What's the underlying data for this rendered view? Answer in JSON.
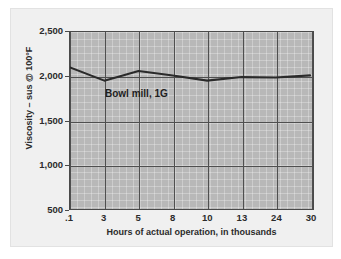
{
  "chart_data": {
    "type": "line",
    "title": "",
    "xlabel": "Hours of actual operation, in thousands",
    "ylabel": "Viscosity – sus @ 100°F",
    "categories": [
      ".1",
      "3",
      "5",
      "8",
      "10",
      "13",
      "24",
      "30"
    ],
    "values": [
      2100,
      1950,
      2060,
      2010,
      1950,
      1990,
      1985,
      2010
    ],
    "series": [
      {
        "name": "Bowl mill, 1G",
        "values": [
          2100,
          1950,
          2060,
          2010,
          1950,
          1990,
          1985,
          2010
        ]
      }
    ],
    "ylim": [
      500,
      2500
    ],
    "yticks": [
      "500",
      "1,000",
      "1,500",
      "2,000",
      "2,500"
    ],
    "ytick_values": [
      500,
      1000,
      1500,
      2000,
      2500
    ],
    "xticks": [
      ".1",
      "3",
      "5",
      "8",
      "10",
      "13",
      "24",
      "30"
    ],
    "grid": true,
    "legend_position": "none",
    "annotations": [
      {
        "text": "Bowl mill, 1G",
        "x": "5",
        "y": 1700
      }
    ],
    "colors": {
      "plot_background": "#b8b8b8",
      "line": "#2a2a2a",
      "grid": "#4f4f4f",
      "axis": "#4a4a4a",
      "text": "#2b2b2b",
      "panel_background": "#f0f0f0"
    }
  },
  "axes": {
    "y": {
      "label": "Viscosity – sus @ 100°F",
      "ticks": [
        {
          "label": "2,500",
          "value": 2500
        },
        {
          "label": "2,000",
          "value": 2000
        },
        {
          "label": "1,500",
          "value": 1500
        },
        {
          "label": "1,000",
          "value": 1000
        },
        {
          "label": "500",
          "value": 500
        }
      ]
    },
    "x": {
      "label": "Hours of actual operation, in thousands",
      "ticks": [
        {
          "label": ".1"
        },
        {
          "label": "3"
        },
        {
          "label": "5"
        },
        {
          "label": "8"
        },
        {
          "label": "10"
        },
        {
          "label": "13"
        },
        {
          "label": "24"
        },
        {
          "label": "30"
        }
      ]
    }
  },
  "annotation": {
    "text": "Bowl mill, 1G"
  }
}
